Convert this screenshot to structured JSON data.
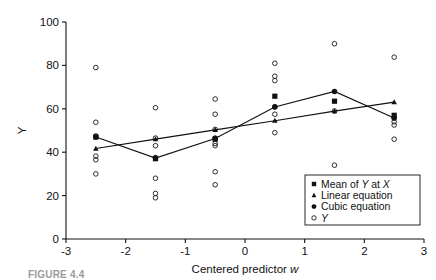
{
  "figure": {
    "caption_partial": "FIGURE 4.4"
  },
  "chart_data": {
    "type": "scatter",
    "title": "",
    "xlabel": "Centered predictor w",
    "ylabel": "Y",
    "xlim": [
      -3,
      3
    ],
    "ylim": [
      0,
      100
    ],
    "xticks": [
      -3,
      -2,
      -1,
      0,
      1,
      2,
      3
    ],
    "yticks": [
      0,
      20,
      40,
      60,
      80,
      100
    ],
    "xtick_labels": [
      "-3",
      "-2",
      "-1",
      "0",
      "1",
      "2",
      "3"
    ],
    "ytick_labels": [
      "0",
      "20",
      "40",
      "60",
      "80",
      "100"
    ],
    "grid": false,
    "legend_position": "lower-right",
    "legend": [
      {
        "marker": "square",
        "label_parts": [
          "Mean of ",
          "Y",
          " at ",
          "X"
        ],
        "label": "Mean of Y at X"
      },
      {
        "marker": "triangle",
        "label_parts": [
          "Linear equation"
        ],
        "label": "Linear equation"
      },
      {
        "marker": "circle",
        "label_parts": [
          "Cubic equation"
        ],
        "label": "Cubic equation"
      },
      {
        "marker": "open-circle",
        "label_parts": [
          "Y"
        ],
        "label": "Y"
      }
    ],
    "x_groups": [
      -2.5,
      -1.5,
      -0.5,
      0.5,
      1.5,
      2.5
    ],
    "series": [
      {
        "name": "Mean of Y at X",
        "marker": "square",
        "x": [
          -2.5,
          -1.5,
          -0.5,
          0.5,
          1.5,
          2.5
        ],
        "values": [
          47.0,
          37.0,
          46.0,
          65.8,
          63.5,
          57.0
        ]
      },
      {
        "name": "Linear equation",
        "marker": "triangle",
        "connected": true,
        "x": [
          -2.5,
          -1.5,
          -0.5,
          0.5,
          1.5,
          2.5
        ],
        "values": [
          41.7,
          46.0,
          50.3,
          54.5,
          58.9,
          63.1
        ]
      },
      {
        "name": "Cubic equation",
        "marker": "circle",
        "connected": true,
        "x": [
          -2.5,
          -1.5,
          -0.5,
          0.5,
          1.5,
          2.5
        ],
        "values": [
          47.0,
          37.3,
          46.3,
          60.8,
          68.0,
          55.8
        ]
      },
      {
        "name": "Y",
        "marker": "open-circle",
        "points": [
          {
            "x": -2.5,
            "y": 79.0
          },
          {
            "x": -2.5,
            "y": 53.8
          },
          {
            "x": -2.5,
            "y": 47.5
          },
          {
            "x": -2.5,
            "y": 38.2
          },
          {
            "x": -2.5,
            "y": 36.5
          },
          {
            "x": -2.5,
            "y": 30.0
          },
          {
            "x": -1.5,
            "y": 60.5
          },
          {
            "x": -1.5,
            "y": 46.5
          },
          {
            "x": -1.5,
            "y": 43.0
          },
          {
            "x": -1.5,
            "y": 37.5
          },
          {
            "x": -1.5,
            "y": 28.0
          },
          {
            "x": -1.5,
            "y": 21.0
          },
          {
            "x": -1.5,
            "y": 19.0
          },
          {
            "x": -0.5,
            "y": 64.5
          },
          {
            "x": -0.5,
            "y": 57.5
          },
          {
            "x": -0.5,
            "y": 50.5
          },
          {
            "x": -0.5,
            "y": 46.5
          },
          {
            "x": -0.5,
            "y": 44.0
          },
          {
            "x": -0.5,
            "y": 43.0
          },
          {
            "x": -0.5,
            "y": 31.0
          },
          {
            "x": -0.5,
            "y": 25.0
          },
          {
            "x": 0.5,
            "y": 81.0
          },
          {
            "x": 0.5,
            "y": 75.0
          },
          {
            "x": 0.5,
            "y": 73.0
          },
          {
            "x": 0.5,
            "y": 61.0
          },
          {
            "x": 0.5,
            "y": 57.5
          },
          {
            "x": 0.5,
            "y": 49.0
          },
          {
            "x": 1.5,
            "y": 90.0
          },
          {
            "x": 1.5,
            "y": 59.0
          },
          {
            "x": 1.5,
            "y": 34.0
          },
          {
            "x": 2.5,
            "y": 83.8
          },
          {
            "x": 2.5,
            "y": 55.8
          },
          {
            "x": 2.5,
            "y": 54.0
          },
          {
            "x": 2.5,
            "y": 52.5
          },
          {
            "x": 2.5,
            "y": 46.0
          }
        ]
      }
    ]
  }
}
